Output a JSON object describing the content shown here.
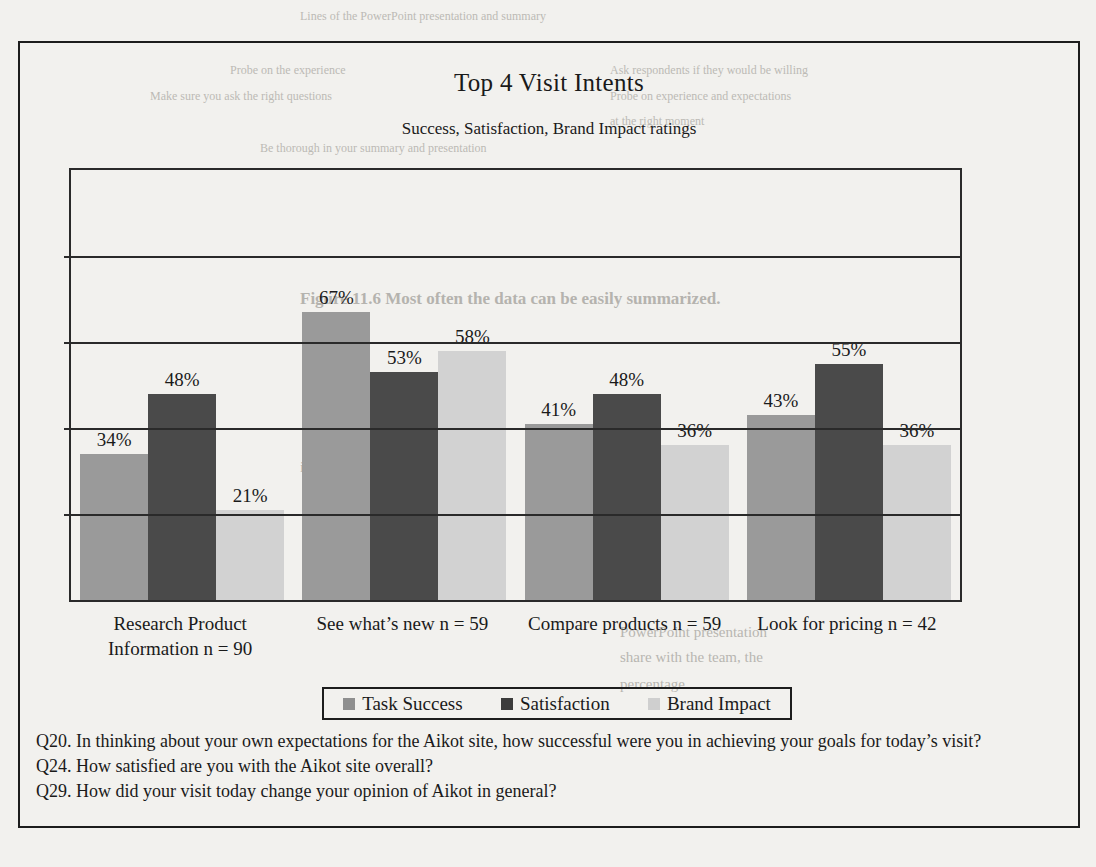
{
  "figure": {
    "title": "Top 4 Visit Intents",
    "subtitle": "Success, Satisfaction, Brand Impact ratings"
  },
  "legend": {
    "items": [
      {
        "label": "Task Success",
        "color": "#8f8f8f"
      },
      {
        "label": "Satisfaction",
        "color": "#3c3c3c"
      },
      {
        "label": "Brand Impact",
        "color": "#cfcfcf"
      }
    ]
  },
  "footnotes": [
    "Q20. In thinking about your own expectations for the Aikot site, how successful were you in achieving your goals for today’s visit?",
    "Q24. How satisfied are you with the Aikot site overall?",
    "Q29. How did your visit today change your opinion of Aikot in general?"
  ],
  "chart_data": {
    "type": "bar",
    "title": "Top 4 Visit Intents",
    "subtitle": "Success, Satisfaction, Brand Impact ratings",
    "xlabel": "",
    "ylabel": "",
    "ylim": [
      0,
      100
    ],
    "grid": true,
    "gridline_values": [
      20,
      40,
      60,
      80,
      100
    ],
    "legend_position": "bottom",
    "categories": [
      "Research Product Information n = 90",
      "See what’s new n = 59",
      "Compare products n = 59",
      "Look for pricing n = 42"
    ],
    "category_lines": [
      [
        "Research Product",
        "Information n = 90"
      ],
      [
        "See what’s new n = 59"
      ],
      [
        "Compare products n = 59"
      ],
      [
        "Look for pricing n = 42"
      ]
    ],
    "series": [
      {
        "name": "Task Success",
        "color": "#9a9a9a",
        "values": [
          34,
          67,
          41,
          43
        ],
        "labels": [
          "34%",
          "67%",
          "41%",
          "43%"
        ]
      },
      {
        "name": "Satisfaction",
        "color": "#4a4a4a",
        "values": [
          48,
          53,
          48,
          55
        ],
        "labels": [
          "48%",
          "53%",
          "48%",
          "55%"
        ]
      },
      {
        "name": "Brand Impact",
        "color": "#d2d2d2",
        "values": [
          21,
          58,
          36,
          36
        ],
        "labels": [
          "21%",
          "58%",
          "36%",
          "36%"
        ]
      }
    ]
  },
  "bleed_through": {
    "top_lines": [
      "Ask respondents if they would be willing to be contacted",
      "Probe on experience and expectations",
      "Make sure you ask the right questions at the right moment"
    ],
    "caption": "Figure 11.6   Most often the data can be easily summarized.",
    "body_lines": [
      "to summarize this information in the PowerPoint presentation",
      "that you will share with the team, the number and the percentage"
    ]
  }
}
